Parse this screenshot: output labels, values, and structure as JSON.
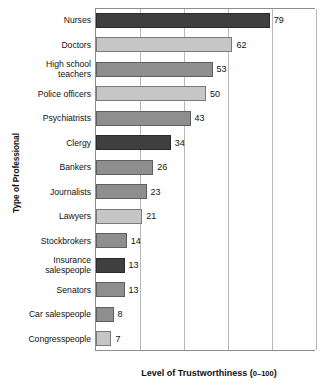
{
  "chart_data": {
    "type": "bar",
    "orientation": "horizontal",
    "title": "",
    "xlabel": "Level of Trustworthiness (0–100)",
    "ylabel": "Type of Professional",
    "xlim": [
      0,
      100
    ],
    "xticks": [
      0,
      20,
      40,
      60,
      80,
      100
    ],
    "grid": "vertical",
    "legend": "none",
    "categories": [
      "Nurses",
      "Doctors",
      "High school teachers",
      "Police officers",
      "Psychiatrists",
      "Clergy",
      "Bankers",
      "Journalists",
      "Lawyers",
      "Stockbrokers",
      "Insurance salespeople",
      "Senators",
      "Car salespeople",
      "Congresspeople"
    ],
    "values": [
      79,
      62,
      53,
      50,
      43,
      34,
      26,
      23,
      21,
      14,
      13,
      13,
      8,
      7
    ],
    "bars": [
      {
        "label": "Nurses",
        "label_lines": [
          "Nurses"
        ],
        "value": 79,
        "value_text": "79",
        "shade": "dark"
      },
      {
        "label": "Doctors",
        "label_lines": [
          "Doctors"
        ],
        "value": 62,
        "value_text": "62",
        "shade": "light"
      },
      {
        "label": "High school teachers",
        "label_lines": [
          "High school",
          "teachers"
        ],
        "value": 53,
        "value_text": "53",
        "shade": "medium"
      },
      {
        "label": "Police officers",
        "label_lines": [
          "Police officers"
        ],
        "value": 50,
        "value_text": "50",
        "shade": "light"
      },
      {
        "label": "Psychiatrists",
        "label_lines": [
          "Psychiatrists"
        ],
        "value": 43,
        "value_text": "43",
        "shade": "medium"
      },
      {
        "label": "Clergy",
        "label_lines": [
          "Clergy"
        ],
        "value": 34,
        "value_text": "34",
        "shade": "dark"
      },
      {
        "label": "Bankers",
        "label_lines": [
          "Bankers"
        ],
        "value": 26,
        "value_text": "26",
        "shade": "medium"
      },
      {
        "label": "Journalists",
        "label_lines": [
          "Journalists"
        ],
        "value": 23,
        "value_text": "23",
        "shade": "medium"
      },
      {
        "label": "Lawyers",
        "label_lines": [
          "Lawyers"
        ],
        "value": 21,
        "value_text": "21",
        "shade": "light"
      },
      {
        "label": "Stockbrokers",
        "label_lines": [
          "Stockbrokers"
        ],
        "value": 14,
        "value_text": "14",
        "shade": "medium"
      },
      {
        "label": "Insurance salespeople",
        "label_lines": [
          "Insurance",
          "salespeople"
        ],
        "value": 13,
        "value_text": "13",
        "shade": "dark"
      },
      {
        "label": "Senators",
        "label_lines": [
          "Senators"
        ],
        "value": 13,
        "value_text": "13",
        "shade": "medium"
      },
      {
        "label": "Car salespeople",
        "label_lines": [
          "Car salespeople"
        ],
        "value": 8,
        "value_text": "8",
        "shade": "medium"
      },
      {
        "label": "Congresspeople",
        "label_lines": [
          "Congresspeople"
        ],
        "value": 7,
        "value_text": "7",
        "shade": "light"
      }
    ],
    "colors": {
      "dark": "#3f3f3f",
      "medium": "#8e8e8e",
      "light": "#c6c6c6",
      "axis": "#8d8d8d",
      "gridline": "#b9b9b9",
      "text": "#111111",
      "background": "#ffffff"
    }
  },
  "axis": {
    "x_title_main": "Level of Trustworthiness (",
    "x_title_range": "0–100",
    "x_title_close": ")",
    "y_title": "Type of Professional"
  }
}
